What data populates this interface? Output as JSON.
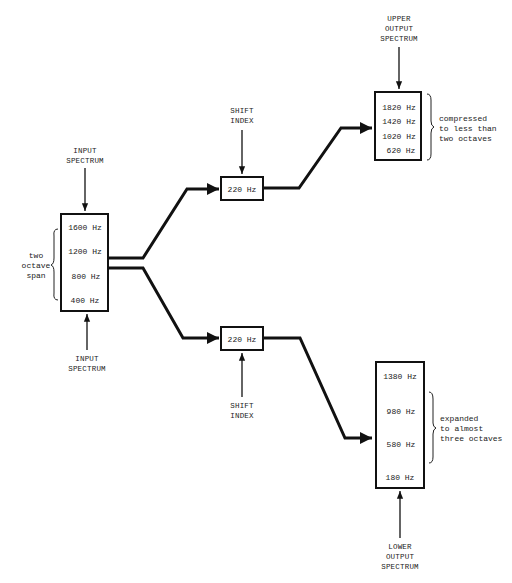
{
  "input": {
    "top_label": [
      "INPUT",
      "SPECTRUM"
    ],
    "bottom_label": [
      "INPUT",
      "SPECTRUM"
    ],
    "frequencies": [
      "1600 Hz",
      "1200 Hz",
      "800 Hz",
      "400 Hz"
    ],
    "annotation": [
      "two",
      "octave",
      "span"
    ]
  },
  "upper_shift": {
    "label": [
      "SHIFT",
      "INDEX"
    ],
    "value": "220 Hz"
  },
  "lower_shift": {
    "label": [
      "SHIFT",
      "INDEX"
    ],
    "value": "220 Hz"
  },
  "upper_output": {
    "label": [
      "UPPER",
      "OUTPUT",
      "SPECTRUM"
    ],
    "frequencies": [
      "1820 Hz",
      "1420 Hz",
      "1020 Hz",
      "620 Hz"
    ],
    "annotation": [
      "compressed",
      "to less than",
      "two octaves"
    ]
  },
  "lower_output": {
    "label": [
      "LOWER",
      "OUTPUT",
      "SPECTRUM"
    ],
    "frequencies": [
      "1380 Hz",
      "980 Hz",
      "580 Hz",
      "180 Hz"
    ],
    "annotation": [
      "expanded",
      "to almost",
      "three octaves"
    ]
  }
}
